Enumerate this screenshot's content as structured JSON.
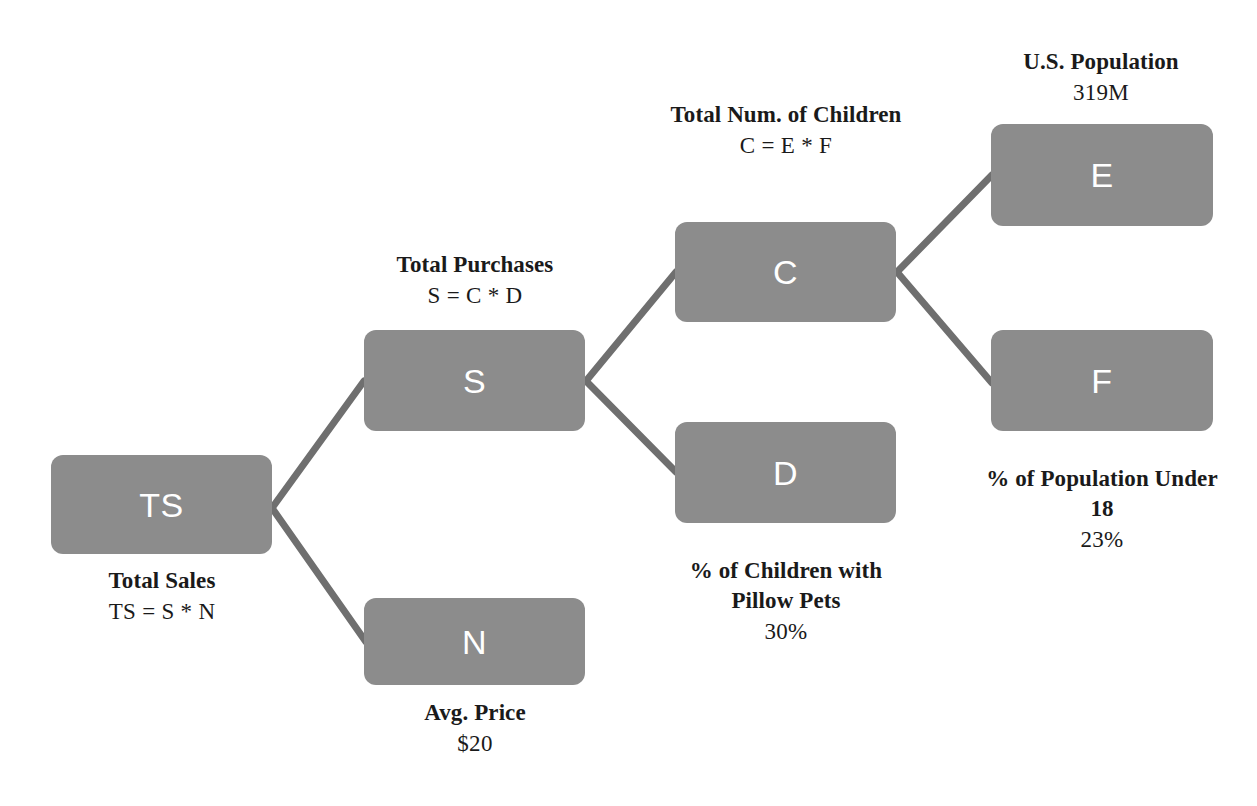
{
  "diagram": {
    "colors": {
      "node_fill": "#8c8c8c",
      "node_text": "#ffffff",
      "edge": "#6f6f6f",
      "caption_text": "#1a1a1a",
      "background": "#ffffff"
    },
    "nodes": [
      {
        "id": "TS",
        "letter": "TS",
        "title": "Total Sales",
        "formula": "TS = S * N",
        "caption_position": "below"
      },
      {
        "id": "S",
        "letter": "S",
        "title": "Total Purchases",
        "formula": "S = C * D",
        "caption_position": "above"
      },
      {
        "id": "N",
        "letter": "N",
        "title": "Avg. Price",
        "formula": "$20",
        "caption_position": "below"
      },
      {
        "id": "C",
        "letter": "C",
        "title": "Total Num. of Children",
        "formula": "C = E * F",
        "caption_position": "above"
      },
      {
        "id": "D",
        "letter": "D",
        "title": "% of Children with Pillow Pets",
        "formula": "30%",
        "caption_position": "below"
      },
      {
        "id": "E",
        "letter": "E",
        "title": "U.S. Population",
        "formula": "319M",
        "caption_position": "above"
      },
      {
        "id": "F",
        "letter": "F",
        "title": "% of Population Under 18",
        "formula": "23%",
        "caption_position": "below"
      }
    ],
    "edges": [
      {
        "from": "TS",
        "to": "S"
      },
      {
        "from": "TS",
        "to": "N"
      },
      {
        "from": "S",
        "to": "C"
      },
      {
        "from": "S",
        "to": "D"
      },
      {
        "from": "C",
        "to": "E"
      },
      {
        "from": "C",
        "to": "F"
      }
    ]
  }
}
